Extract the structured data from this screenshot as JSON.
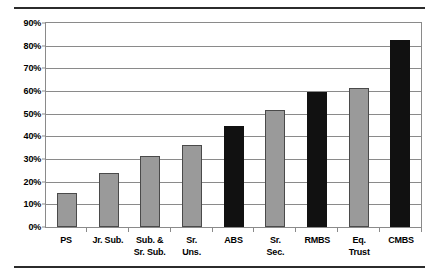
{
  "chart_data": {
    "type": "bar",
    "title": "",
    "subtitle": "",
    "xlabel": "",
    "ylabel": "",
    "ylim": [
      0,
      90
    ],
    "ytick_labels": [
      "90%",
      "80%",
      "70%",
      "60%",
      "50%",
      "40%",
      "30%",
      "20%",
      "10%",
      "0%"
    ],
    "ytick_values": [
      90,
      80,
      70,
      60,
      50,
      40,
      30,
      20,
      10,
      0
    ],
    "grid": true,
    "legend": "none",
    "categories": [
      "PS",
      "Jr. Sub.",
      "Sub. & Sr. Sub.",
      "Sr. Uns.",
      "ABS",
      "Sr. Sec.",
      "RMBS",
      "Eq. Trust",
      "CMBS"
    ],
    "category_label_lines": [
      [
        "PS",
        ""
      ],
      [
        "Jr. Sub.",
        ""
      ],
      [
        "Sub. &",
        "Sr. Sub."
      ],
      [
        "Sr.",
        "Uns."
      ],
      [
        "ABS",
        ""
      ],
      [
        "Sr.",
        "Sec."
      ],
      [
        "RMBS",
        ""
      ],
      [
        "Eq.",
        "Trust"
      ],
      [
        "CMBS",
        ""
      ]
    ],
    "values": [
      15,
      24,
      31.5,
      36,
      44.5,
      51.5,
      59.5,
      61.5,
      82.5
    ],
    "bar_colors": [
      "#9a9a9a",
      "#9a9a9a",
      "#9a9a9a",
      "#9a9a9a",
      "#111111",
      "#9a9a9a",
      "#111111",
      "#9a9a9a",
      "#111111"
    ],
    "bar_styles": [
      "gray",
      "gray",
      "gray",
      "gray",
      "black",
      "gray",
      "black",
      "gray",
      "black"
    ],
    "colors": {
      "gray_bar": "#9a9a9a",
      "black_bar": "#111111",
      "gridline": "#8a8a8a",
      "rule": "#2b2b2b",
      "background": "#ffffff",
      "text": "#000000"
    }
  }
}
